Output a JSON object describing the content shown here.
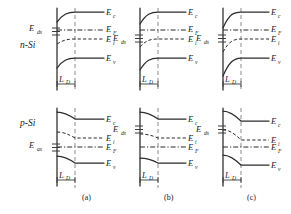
{
  "figure": {
    "caption_row_labels": [
      "n-Si",
      "p-Si"
    ],
    "panels": [
      {
        "id": "a",
        "label": "(a)"
      },
      {
        "id": "b",
        "label": "(b)"
      },
      {
        "id": "c",
        "label": "(c)"
      }
    ],
    "energy_labels": {
      "Ec": "E",
      "Ec_sub": "c",
      "EF": "E",
      "EF_sub": "F",
      "Ei": "E",
      "Ei_sub": "i",
      "Ev": "E",
      "Ev_sub": "v",
      "Eds": "E",
      "Eds_sub": "ds",
      "Eas": "E",
      "Eas_sub": "as",
      "LD": "L",
      "LD_sub": "D"
    },
    "rows": [
      {
        "material": "n-Si",
        "surface_state_label": "E",
        "surface_state_sub": "ds",
        "level_order_top_to_bottom": [
          "Ec",
          "EF",
          "Ei",
          "Ev"
        ],
        "band_bending": "downward",
        "bending_strength": [
          "weak",
          "medium",
          "strong"
        ],
        "depletion_label": "L",
        "depletion_sub": "D"
      },
      {
        "material": "p-Si",
        "surface_state_label": "E",
        "surface_state_sub": "as",
        "level_order_top_to_bottom": [
          "Ec",
          "Ei",
          "EF",
          "Ev"
        ],
        "band_bending": "upward",
        "bending_strength": [
          "weak",
          "medium",
          "strong"
        ],
        "depletion_label": "L",
        "depletion_sub": "D"
      }
    ],
    "colors": {
      "band": "#2b2b2b",
      "surface_state": "#6f6f6f",
      "dashed_vertical": "#8a8a8a",
      "text": "#1a1a1a",
      "background": "#ffffff"
    }
  }
}
